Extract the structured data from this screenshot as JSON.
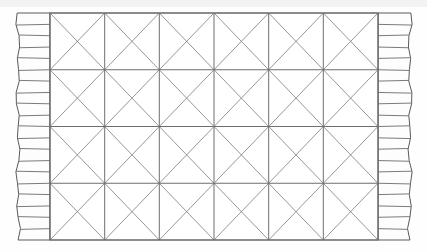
{
  "canvas": {
    "width": 427,
    "height": 252,
    "background_color": "#fefefe",
    "top_band_color": "#f2f2f2",
    "top_band_height": 7
  },
  "rug": {
    "label": "rug-body",
    "x": 50,
    "y": 13,
    "width": 328,
    "height": 227,
    "fill_color": "#ffffff",
    "border_color": "#6b6b6b",
    "border_width": 1.1
  },
  "grid": {
    "label": "diamond-lattice-grid",
    "columns": 6,
    "rows": 4,
    "line_color": "#6e6e6e",
    "line_width": 1.0,
    "vertical_line_x": [
      50,
      104.7,
      159.3,
      214.0,
      268.7,
      323.3,
      378
    ],
    "horizontal_line_y": [
      13,
      69.75,
      126.5,
      183.25,
      240
    ]
  },
  "diagonals": {
    "label": "cell-diagonals",
    "line_color": "#8a8a8a",
    "line_width": 0.9,
    "per_cell": 2,
    "description": "both diagonals of every grid cell, forming diamonds centered on grid intersections"
  },
  "fringe": {
    "label": "fringe-tassels",
    "strand_count": 20,
    "left": {
      "label": "left-fringe",
      "outer_x": 18,
      "inner_x": 50,
      "top_y": 13,
      "bottom_y": 240
    },
    "right": {
      "label": "right-fringe",
      "inner_x": 378,
      "outer_x": 410,
      "top_y": 13,
      "bottom_y": 240
    },
    "strand_color": "#6b6b6b",
    "strand_width": 0.9,
    "contour_color": "#5a5a5a",
    "contour_width": 1.0,
    "fill_color": "#fdfdfd",
    "wave_amplitude": 3.2
  },
  "colors": {
    "ink_dark": "#5a5a5a",
    "ink_mid": "#6e6e6e",
    "ink_light": "#8a8a8a",
    "paper": "#ffffff"
  }
}
